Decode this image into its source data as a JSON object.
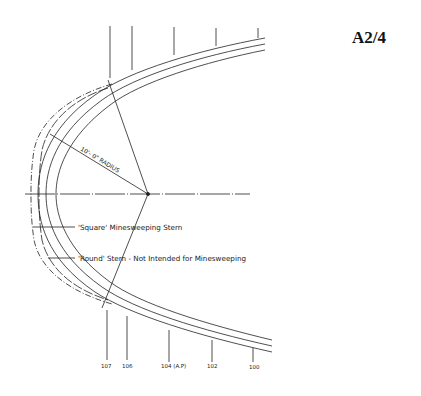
{
  "page": {
    "id": "A2/4"
  },
  "drawing": {
    "type": "ship stern plan (waterline) diagram",
    "radius_label": "10'- 0\" RADIUS",
    "annotations": [
      {
        "id": "square",
        "text": "'Square' Minesweeping Stern"
      },
      {
        "id": "round",
        "text": "'Round' Stern - Not Intended for Minesweeping"
      }
    ],
    "stations": [
      {
        "label": "107"
      },
      {
        "label": "106"
      },
      {
        "label": "104 (A.P)"
      },
      {
        "label": "102"
      },
      {
        "label": "100"
      }
    ]
  }
}
